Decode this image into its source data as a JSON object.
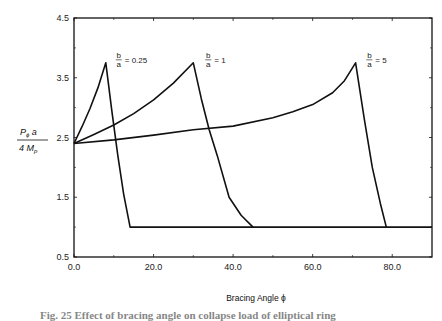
{
  "chart_data": {
    "type": "line",
    "title": "",
    "xlabel": "Bracing Angle ϕ",
    "ylabel": "Pϕ a / 4 Mp",
    "ylabel_parts": {
      "num_main": "P",
      "num_sub": "ϕ",
      "num_tail": " a",
      "den_main": "4 M",
      "den_sub": "p"
    },
    "xlim": [
      0,
      90
    ],
    "ylim": [
      0.5,
      4.5
    ],
    "x_ticks": [
      0,
      20,
      40,
      60,
      80
    ],
    "x_tick_labels": [
      "0.0",
      "20.0",
      "40.0",
      "60.0",
      "80.0"
    ],
    "x_minor_ticks": [
      10,
      30,
      50,
      70
    ],
    "y_ticks": [
      0.5,
      1.5,
      2.5,
      3.5,
      4.5
    ],
    "y_tick_labels": [
      "0.5",
      "1.5",
      "2.5",
      "3.5",
      "4.5"
    ],
    "y_minor_ticks": [
      1.0,
      2.0,
      3.0,
      4.0
    ],
    "grid": false,
    "legend": "inline annotations near peaks",
    "series": [
      {
        "name": "b/a = 0.25",
        "label": {
          "num": "b",
          "den": "a",
          "value": "= 0.25"
        },
        "x": [
          0,
          2,
          4,
          6,
          8,
          9.5,
          11,
          12.5,
          14.1,
          90
        ],
        "y": [
          2.4,
          2.68,
          2.98,
          3.33,
          3.75,
          2.95,
          2.2,
          1.55,
          1.0,
          1.0
        ]
      },
      {
        "name": "b/a = 1",
        "label": {
          "num": "b",
          "den": "a",
          "value": "= 1"
        },
        "x": [
          0,
          5,
          10,
          15,
          20,
          25,
          30,
          32,
          34,
          36,
          39,
          42,
          45
        ],
        "y": [
          2.4,
          2.55,
          2.71,
          2.9,
          3.13,
          3.41,
          3.75,
          3.15,
          2.63,
          2.2,
          1.5,
          1.2,
          1.0
        ]
      },
      {
        "name": "b/a = 5",
        "label": {
          "num": "b",
          "den": "a",
          "value": "= 5"
        },
        "x": [
          0,
          10,
          20,
          30,
          40,
          50,
          55,
          60,
          65,
          68,
          70.8,
          73,
          75,
          77,
          78.5
        ],
        "y": [
          2.4,
          2.46,
          2.54,
          2.63,
          2.69,
          2.83,
          2.93,
          3.05,
          3.25,
          3.45,
          3.75,
          2.8,
          2.0,
          1.4,
          1.0
        ]
      }
    ],
    "label_positions": [
      {
        "x": 10.5,
        "y": 3.8
      },
      {
        "x": 33,
        "y": 3.8
      },
      {
        "x": 73.5,
        "y": 3.8
      }
    ]
  },
  "caption": "Fig. 25 Effect of bracing angle on collapse load of elliptical ring"
}
